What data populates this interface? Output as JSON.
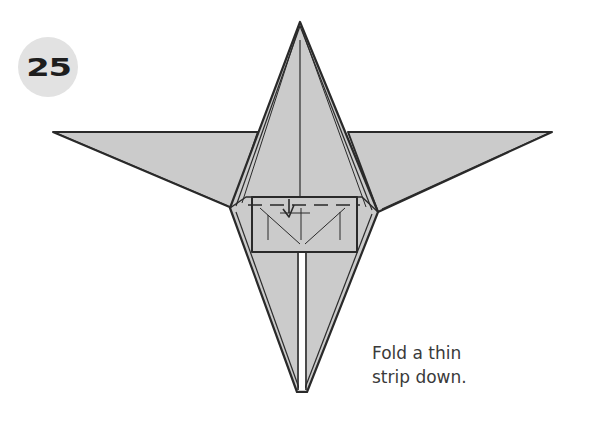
{
  "step": {
    "number": "25",
    "badge_color": "#e2e2e2"
  },
  "instruction": {
    "lines": [
      "Fold a thin",
      "strip down."
    ]
  },
  "diagram": {
    "paper_color": "#cbcbcb",
    "line_color": "#2a2a2a",
    "symbols": [
      "valley-fold-line",
      "fold-arrow"
    ]
  }
}
